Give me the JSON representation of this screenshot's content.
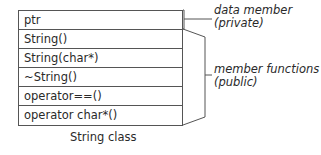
{
  "diagram": {
    "rows": [
      {
        "label": "ptr",
        "kind": "data"
      },
      {
        "label": "String()",
        "kind": "function"
      },
      {
        "label": "String(char*)",
        "kind": "function"
      },
      {
        "label": "~String()",
        "kind": "function"
      },
      {
        "label": "operator==()",
        "kind": "function"
      },
      {
        "label": "operator char*()",
        "kind": "function"
      }
    ],
    "caption": "String class",
    "annotations": {
      "data_member": {
        "line1": "data member",
        "line2": "(private)"
      },
      "member_functions": {
        "line1": "member functions",
        "line2": "(public)"
      }
    },
    "colors": {
      "line": "#555555",
      "text": "#2a2a2a",
      "background": "#ffffff"
    }
  }
}
